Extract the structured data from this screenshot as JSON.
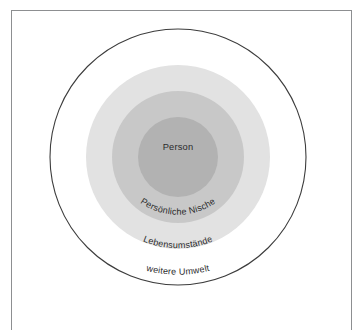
{
  "figure": {
    "type": "concentric-circles-diagram",
    "language": "de",
    "background_color": "#ffffff",
    "frame_color": "#8d8f91",
    "text_color": "#2b2b2b",
    "center": {
      "x": 178,
      "y": 157
    },
    "rings": [
      {
        "id": "weitere-umwelt",
        "label": "weitere Umwelt",
        "level": 4,
        "radius": 128,
        "fill": "#ffffff",
        "stroke": "#3c3c3c",
        "label_placement": "arc-bottom"
      },
      {
        "id": "lebensumstaende",
        "label": "Lebensumstände",
        "level": 3,
        "radius": 92,
        "fill": "#e2e2e2",
        "stroke": "none",
        "label_placement": "arc-bottom"
      },
      {
        "id": "persoenliche-nische",
        "label": "Persönliche Nische",
        "level": 2,
        "radius": 66,
        "fill": "#c8c8c8",
        "stroke": "none",
        "label_placement": "arc-bottom"
      },
      {
        "id": "person",
        "label": "Person",
        "level": 1,
        "radius": 40,
        "fill": "#b2b2b2",
        "stroke": "none",
        "label_placement": "center"
      }
    ]
  },
  "labels": {
    "person": "Person",
    "persoenliche_nische": "Persönliche Nische",
    "lebensumstaende": "Lebensumstände",
    "weitere_umwelt": "weitere Umwelt"
  }
}
